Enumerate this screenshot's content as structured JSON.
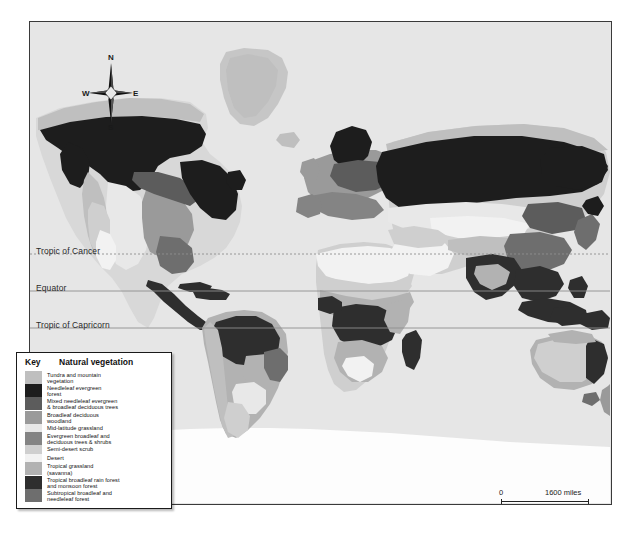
{
  "map": {
    "background_color": "#e6e6e6",
    "frame_color": "#3a3a3a",
    "ocean_color": "#e6e6e6",
    "antarctica_color": "#fdfdfd"
  },
  "compass": {
    "north": "N",
    "east": "E",
    "south": "S",
    "west": "W"
  },
  "graticule": {
    "labels": [
      {
        "name": "tropic-of-cancer",
        "text": "Tropic of Cancer",
        "y": 253,
        "style": "dotted"
      },
      {
        "name": "equator",
        "text": "Equator",
        "y": 290,
        "style": "solid"
      },
      {
        "name": "tropic-of-capricorn",
        "text": "Tropic of Capricorn",
        "y": 327,
        "style": "solid"
      }
    ]
  },
  "scale": {
    "zero_miles": "0",
    "zero_km": "0",
    "miles_label": "1600 miles",
    "km_label": "2600 km"
  },
  "legend": {
    "key_title": "Key",
    "main_title": "Natural vegetation",
    "items": [
      {
        "color": "#bfbfbf",
        "lines": [
          "Tundra and mountain",
          "vegetation"
        ]
      },
      {
        "color": "#1d1d1d",
        "lines": [
          "Needleleaf evergreen",
          "forest"
        ]
      },
      {
        "color": "#5c5c5c",
        "lines": [
          "Mixed needleleaf evergreen",
          "& broadleaf deciduous trees"
        ]
      },
      {
        "color": "#9a9a9a",
        "lines": [
          "Broadleaf deciduous",
          "woodland"
        ]
      },
      {
        "color": "#e8e8e8",
        "lines": [
          "Mid-latitude grassland"
        ]
      },
      {
        "color": "#848484",
        "lines": [
          "Evergreen broadleaf and",
          "deciduous trees & shrubs"
        ]
      },
      {
        "color": "#cfcfcf",
        "lines": [
          "Semi-desert scrub"
        ]
      },
      {
        "color": "#f2f2f2",
        "lines": [
          "Desert"
        ]
      },
      {
        "color": "#b2b2b2",
        "lines": [
          "Tropical grassland",
          "(savanna)"
        ]
      },
      {
        "color": "#2e2e2e",
        "lines": [
          "Tropical broadleaf rain forest",
          "and monsoon forest"
        ]
      },
      {
        "color": "#6e6e6e",
        "lines": [
          "Subtropical broadleaf and",
          "needleleaf forest"
        ]
      }
    ]
  },
  "chart_data": {
    "type": "map",
    "title": "Natural vegetation",
    "projection": "world-thematic",
    "categories": [
      "Tundra and mountain vegetation",
      "Needleleaf evergreen forest",
      "Mixed needleleaf evergreen & broadleaf deciduous trees",
      "Broadleaf deciduous woodland",
      "Mid-latitude grassland",
      "Evergreen broadleaf and deciduous trees & shrubs",
      "Semi-desert scrub",
      "Desert",
      "Tropical grassland (savanna)",
      "Tropical broadleaf rain forest and monsoon forest",
      "Subtropical broadleaf and needleleaf forest"
    ],
    "colors": [
      "#bfbfbf",
      "#1d1d1d",
      "#5c5c5c",
      "#9a9a9a",
      "#e8e8e8",
      "#848484",
      "#cfcfcf",
      "#f2f2f2",
      "#b2b2b2",
      "#2e2e2e",
      "#6e6e6e"
    ],
    "reference_lines": [
      "Tropic of Cancer",
      "Equator",
      "Tropic of Capricorn"
    ],
    "scale_bar": {
      "miles": 1600,
      "km": 2600
    }
  }
}
